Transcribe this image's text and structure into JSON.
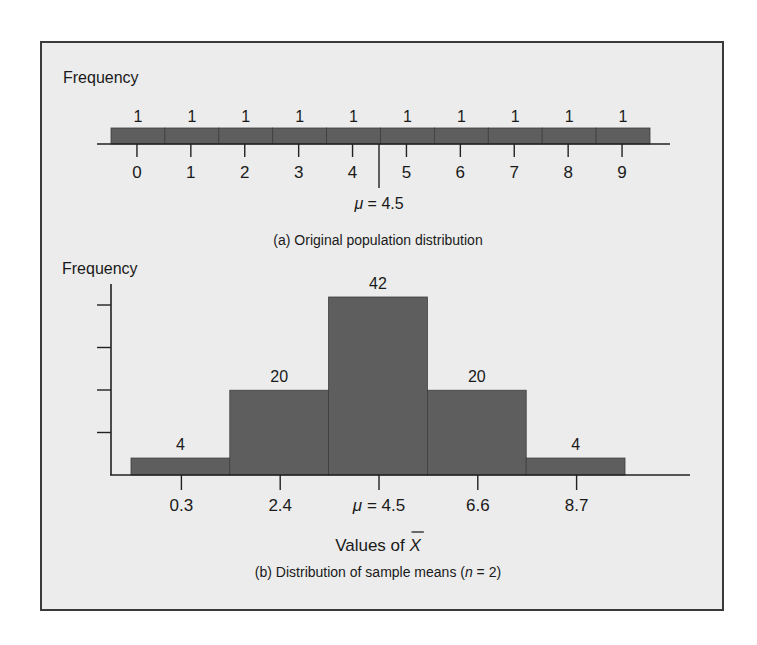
{
  "colors": {
    "bar_fill": "#5e5e5e",
    "bar_edge": "#3c3c3c",
    "axis": "#222222",
    "panel_bg": "#ececec",
    "frame": "#3a3a3a"
  },
  "top_panel": {
    "ylabel": "Frequency",
    "caption": "(a) Original population distribution",
    "mean_marker": {
      "mu_symbol": "μ",
      "equals_value": " = 4.5"
    }
  },
  "bottom_panel": {
    "ylabel": "Frequency",
    "xlabel_prefix": "Values of ",
    "xlabel_symbol": "X",
    "caption_prefix": "(b) Distribution of sample means (",
    "caption_n": "n",
    "caption_suffix": " = 2)"
  },
  "chart_data": [
    {
      "type": "bar",
      "title": "(a) Original population distribution",
      "xlabel": "",
      "ylabel": "Frequency",
      "categories": [
        "0",
        "1",
        "2",
        "3",
        "4",
        "5",
        "6",
        "7",
        "8",
        "9"
      ],
      "values": [
        1,
        1,
        1,
        1,
        1,
        1,
        1,
        1,
        1,
        1
      ],
      "data_labels": [
        "1",
        "1",
        "1",
        "1",
        "1",
        "1",
        "1",
        "1",
        "1",
        "1"
      ],
      "annotations": [
        {
          "text": "μ = 4.5",
          "x": 4.5,
          "type": "vertical-marker"
        }
      ],
      "grid": false,
      "legend": null
    },
    {
      "type": "bar",
      "title": "(b) Distribution of sample means (n = 2)",
      "xlabel": "Values of X̄",
      "ylabel": "Frequency",
      "categories": [
        "0.3",
        "2.4",
        "μ = 4.5",
        "6.6",
        "8.7"
      ],
      "x": [
        0.3,
        2.4,
        4.5,
        6.6,
        8.7
      ],
      "values": [
        4,
        20,
        42,
        20,
        4
      ],
      "data_labels": [
        "4",
        "20",
        "42",
        "20",
        "4"
      ],
      "ylim": [
        0,
        45
      ],
      "y_ticks_unlabeled": 4,
      "grid": false,
      "legend": null
    }
  ]
}
